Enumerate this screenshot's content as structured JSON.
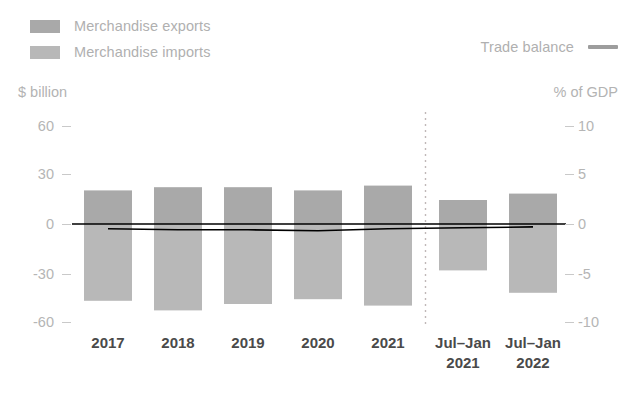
{
  "legend": {
    "items": [
      {
        "label": "Merchandise exports",
        "marker": "swatch",
        "color": "#a9a9a9"
      },
      {
        "label": "Merchandise imports",
        "marker": "swatch",
        "color": "#b8b8b8"
      }
    ],
    "line_item": {
      "label": "Trade balance",
      "marker": "line",
      "color": "#9d9d9d"
    }
  },
  "axes": {
    "left_unit": "$ billion",
    "right_unit": "% of GDP",
    "left_ticks": [
      "60",
      "30",
      "0",
      "-30",
      "-60"
    ],
    "right_ticks": [
      "10",
      "5",
      "0",
      "-5",
      "-10"
    ]
  },
  "chart_data": {
    "type": "bar",
    "title": "",
    "subtitle": "",
    "xlabel": "",
    "ylabel": "$ billion",
    "y2label": "% of GDP",
    "ylim": [
      -70,
      70
    ],
    "y2lim": [
      -11.67,
      11.67
    ],
    "yticks": [
      60,
      30,
      0,
      -30,
      -60
    ],
    "y2ticks": [
      10,
      5,
      0,
      -5,
      -10
    ],
    "grid": false,
    "legend_position": "top",
    "categories": [
      "2017",
      "2018",
      "2019",
      "2020",
      "2021",
      "Jul-Jan 2021",
      "Jul-Jan 2022"
    ],
    "category_lines": [
      [
        "2017",
        ""
      ],
      [
        "2018",
        ""
      ],
      [
        "2019",
        ""
      ],
      [
        "2020",
        ""
      ],
      [
        "2021",
        ""
      ],
      [
        "Jul–Jan",
        "2021"
      ],
      [
        "Jul–Jan",
        "2022"
      ]
    ],
    "series": [
      {
        "name": "Merchandise exports",
        "axis": "left",
        "unit": "$ billion",
        "color": "#a9a9a9",
        "values": [
          21,
          23,
          23,
          21,
          24,
          15,
          19
        ]
      },
      {
        "name": "Merchandise imports",
        "axis": "left",
        "unit": "$ billion",
        "color": "#b8b8b8",
        "values": [
          -48,
          -54,
          -50,
          -47,
          -51,
          -29,
          -43
        ]
      },
      {
        "name": "Trade balance",
        "axis": "right",
        "unit": "% of GDP",
        "color": "#000000",
        "values": [
          -0.5,
          -0.6,
          -0.6,
          -0.7,
          -0.5,
          -0.4,
          -0.3
        ]
      }
    ],
    "annotations": [
      {
        "type": "vertical-divider",
        "style": "dotted",
        "after_category": "2021"
      }
    ]
  }
}
